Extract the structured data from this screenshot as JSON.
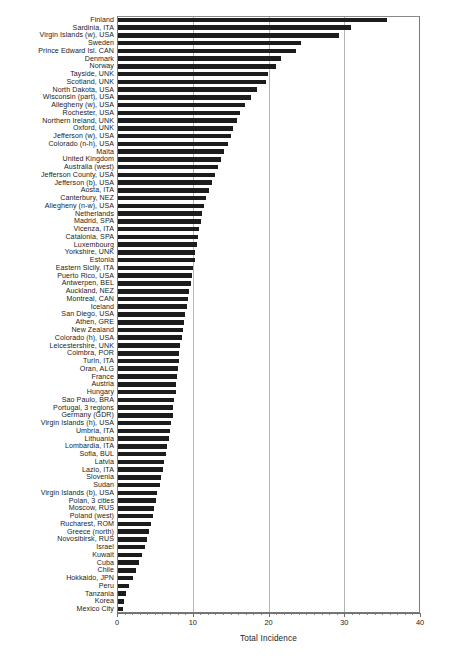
{
  "chart_data": {
    "type": "bar",
    "orientation": "horizontal",
    "title": "",
    "xlabel": "Total Incidence",
    "ylabel": "",
    "xlim": [
      0,
      40
    ],
    "xticks": [
      0,
      10,
      20,
      30,
      40
    ],
    "xtick_labels": [
      "0",
      "10",
      "20",
      "30",
      "40"
    ],
    "grid": "vertical-major-only",
    "legend": "none",
    "bar_color": "#1c1c1c",
    "categories": [
      "Finland",
      "Sardinia, ITA",
      "Virgin Islands (w), USA",
      "Sweden",
      "Prince Edward Isl. CAN",
      "Denmark",
      "Norway",
      "Tayside, UNK",
      "Scotland, UNK",
      "North Dakota, USA",
      "Wisconsin (part), USA",
      "Allegheny (w), USA",
      "Rochester, USA",
      "Northern Ireland, UNK",
      "Oxford, UNK",
      "Jefferson (w), USA",
      "Colorado (n-h), USA",
      "Malta",
      "United Kingdom",
      "Australia (west)",
      "Jefferson County, USA",
      "Jefferson (b), USA",
      "Aosta, ITA",
      "Canterbury, NEZ",
      "Allegheny (n-w), USA",
      "Netherlands",
      "Madrid, SPA",
      "Vicenza, ITA",
      "Catalonia, SPA",
      "Luxembourg",
      "Yorkshire, UNK",
      "Estonia",
      "Eastern Sicily, ITA",
      "Puerto Rico, USA",
      "Antwerpen, BEL",
      "Auckland, NEZ",
      "Montreal, CAN",
      "Iceland",
      "San Diego, USA",
      "Athen, GRE",
      "New Zealand",
      "Colorado (h), USA",
      "Leicestershire, UNK",
      "Coimbra, POR",
      "Turin, ITA",
      "Oran, ALG",
      "France",
      "Austria",
      "Hungary",
      "Sao Paulo, BRA",
      "Portugal, 3 regions",
      "Germany (GDR)",
      "Virgin Islands (h), USA",
      "Umbria, ITA",
      "Lithuania",
      "Lombardia, ITA",
      "Sofia, BUL",
      "Latvia",
      "Lazio, ITA",
      "Slovenia",
      "Sudan",
      "Virgin Islands (b), USA",
      "Polan, 3 cities",
      "Moscow, RUS",
      "Poland (west)",
      "Rucharest, ROM",
      "Greece (north)",
      "Novosibirsk, RUS",
      "Israel",
      "Kuwait",
      "Cuba",
      "Chile",
      "Hokkaido, JPN",
      "Peru",
      "Tanzania",
      "Korea",
      "Mexico City"
    ],
    "values": [
      35.5,
      30.7,
      29.2,
      24.2,
      23.5,
      21.5,
      20.8,
      19.8,
      19.6,
      18.4,
      17.6,
      16.8,
      16.1,
      15.7,
      15.2,
      14.9,
      14.5,
      14.0,
      13.6,
      13.2,
      12.8,
      12.4,
      12.0,
      11.6,
      11.4,
      11.1,
      10.9,
      10.7,
      10.5,
      10.4,
      10.2,
      10.1,
      9.9,
      9.8,
      9.6,
      9.4,
      9.2,
      9.1,
      8.9,
      8.7,
      8.6,
      8.4,
      8.2,
      8.1,
      8.0,
      7.9,
      7.8,
      7.7,
      7.6,
      7.4,
      7.3,
      7.2,
      7.0,
      6.9,
      6.7,
      6.5,
      6.3,
      6.1,
      5.9,
      5.7,
      5.5,
      5.2,
      5.0,
      4.8,
      4.6,
      4.3,
      4.1,
      3.8,
      3.5,
      3.2,
      2.8,
      2.4,
      2.0,
      1.4,
      1.1,
      0.8,
      0.6
    ]
  }
}
